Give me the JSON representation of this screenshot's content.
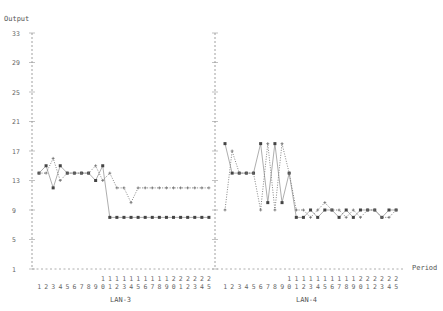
{
  "chart_data": {
    "type": "line",
    "title": "",
    "ylabel": "Output",
    "xlabel": "Period",
    "ylim": [
      1,
      33
    ],
    "yticks": [
      1,
      5,
      9,
      13,
      17,
      21,
      25,
      29,
      33
    ],
    "grid": false,
    "legend": null,
    "panels": [
      {
        "name": "LAN-3",
        "x": [
          1,
          2,
          3,
          4,
          5,
          6,
          7,
          8,
          9,
          10,
          11,
          12,
          13,
          14,
          15,
          16,
          17,
          18,
          19,
          20,
          21,
          22,
          23,
          24,
          25
        ],
        "series": [
          {
            "name": "solid",
            "style": "solid-square",
            "values": [
              14,
              15,
              12,
              15,
              14,
              14,
              14,
              14,
              13,
              15,
              8,
              8,
              8,
              8,
              8,
              8,
              8,
              8,
              8,
              8,
              8,
              8,
              8,
              8,
              8
            ]
          },
          {
            "name": "dotted",
            "style": "dotted-plus",
            "values": [
              14,
              14,
              16,
              13,
              14,
              14,
              14,
              14,
              15,
              13,
              14,
              12,
              12,
              10,
              12,
              12,
              12,
              12,
              12,
              12,
              12,
              12,
              12,
              12,
              12
            ]
          }
        ]
      },
      {
        "name": "LAN-4",
        "x": [
          1,
          2,
          3,
          4,
          5,
          6,
          7,
          8,
          9,
          10,
          11,
          12,
          13,
          14,
          15,
          16,
          17,
          18,
          19,
          20,
          21,
          22,
          23,
          24,
          25
        ],
        "series": [
          {
            "name": "solid",
            "style": "solid-square",
            "values": [
              18,
              14,
              14,
              14,
              14,
              18,
              10,
              18,
              10,
              14,
              8,
              8,
              9,
              8,
              9,
              9,
              8,
              9,
              8,
              9,
              9,
              9,
              8,
              9,
              9
            ]
          },
          {
            "name": "dotted",
            "style": "dotted-plus",
            "values": [
              9,
              17,
              14,
              14,
              14,
              9,
              18,
              9,
              18,
              14,
              9,
              9,
              8,
              9,
              10,
              9,
              9,
              8,
              9,
              8,
              9,
              9,
              8,
              8,
              9
            ]
          }
        ]
      }
    ]
  },
  "labels": {
    "y_axis_title": "Output",
    "x_axis_title": "Period",
    "panel1": "LAN-3",
    "panel2": "LAN-4"
  }
}
